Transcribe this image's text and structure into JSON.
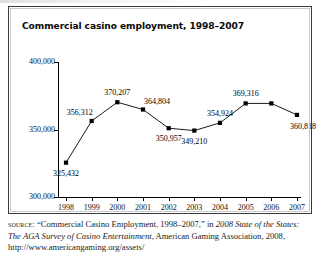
{
  "figure": {
    "title": "Commercial casino employment, 1998–2007"
  },
  "chart_data": {
    "type": "line",
    "title": "Commercial casino employment, 1998–2007",
    "xlabel": "",
    "ylabel": "",
    "ylim": [
      300000,
      400000
    ],
    "yticks": [
      "300,000",
      "350,000",
      "400,000"
    ],
    "ytick_values": [
      300000,
      350000,
      400000
    ],
    "grid": false,
    "legend": "none",
    "categories": [
      "1998",
      "1999",
      "2000",
      "2001",
      "2002",
      "2003",
      "2004",
      "2005",
      "2006",
      "2007"
    ],
    "values": [
      325432,
      356312,
      370207,
      364804,
      350957,
      349210,
      354924,
      369316,
      369316,
      360818
    ],
    "point_labels": [
      {
        "year": "1998",
        "value": 325432,
        "text": "325,432",
        "position": "below"
      },
      {
        "year": "1999",
        "value": 356312,
        "text": "356,312",
        "position": "above-left"
      },
      {
        "year": "2000",
        "value": 370207,
        "text": "370,207",
        "position": "above"
      },
      {
        "year": "2001",
        "value": 364804,
        "text": "364,804",
        "position": "above-right"
      },
      {
        "year": "2002",
        "value": 350957,
        "text": "350,957",
        "position": "below"
      },
      {
        "year": "2003",
        "value": 349210,
        "text": "349,210",
        "position": "below"
      },
      {
        "year": "2004",
        "value": 354924,
        "text": "354,924",
        "position": "above"
      },
      {
        "year": "2005",
        "value": 369316,
        "text": "369,316",
        "position": "above"
      },
      {
        "year": "2007",
        "value": 360818,
        "text": "360,818",
        "position": "below-right"
      }
    ],
    "marker": "square",
    "marker_color": "#000000",
    "line_color": "#000000"
  },
  "source": {
    "label": "source:",
    "text_1": " “Commercial Casino Employment, 1998–2007,” in ",
    "italic_1": "2008 State of the States: The AGA Survey of Casino Entertainment",
    "text_2": ", American Gaming Association, 2008, http://www.americangaming.org/assets/"
  }
}
